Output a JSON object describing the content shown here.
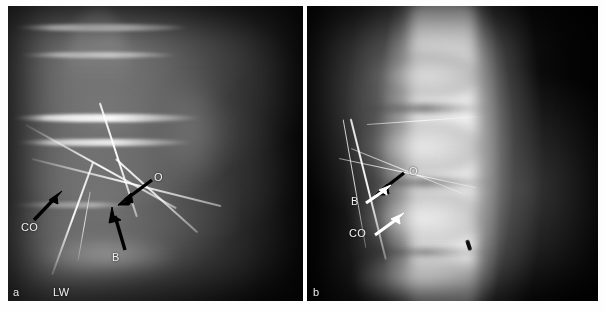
{
  "figure": {
    "kind": "radiograph-figure",
    "panel_count": 2,
    "background_color": "#ffffff"
  },
  "panels": [
    {
      "id": "panel-a",
      "letter": "a",
      "view": "lateral lumbar spine radiograph",
      "annotations": [
        {
          "label": "O",
          "arrow_color": "#000000",
          "arrow_direction": "down-left"
        },
        {
          "label": "CO",
          "arrow_color": "#000000",
          "arrow_direction": "up-right"
        },
        {
          "label": "B",
          "arrow_color": "#000000",
          "arrow_direction": "up-right"
        },
        {
          "label": "LW",
          "arrow_color": "none",
          "arrow_direction": "none"
        }
      ]
    },
    {
      "id": "panel-b",
      "letter": "b",
      "view": "anteroposterior lumbar spine radiograph",
      "annotations": [
        {
          "label": "O",
          "arrow_color": "#000000",
          "arrow_direction": "down-left"
        },
        {
          "label": "B",
          "arrow_color": "#ffffff",
          "arrow_direction": "up-right"
        },
        {
          "label": "CO",
          "arrow_color": "#ffffff",
          "arrow_direction": "up-right"
        }
      ]
    }
  ],
  "colors": {
    "film_black": "#050505",
    "bone_white": "#f5f5f5",
    "label_white": "#f2f2f2",
    "arrow_black": "#000000",
    "page_white": "#ffffff"
  }
}
